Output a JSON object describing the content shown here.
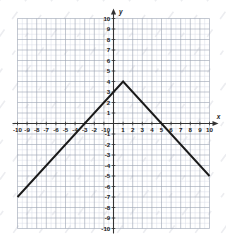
{
  "figure": {
    "kind": "coordinate-grid-plot",
    "background_color": "#ffffff",
    "grid": {
      "minor_color": "#d8dce6",
      "major_color": "#9aa3b2",
      "axis_color": "#333333",
      "minor_step": 0.5,
      "major_step": 1,
      "show_grid": true
    },
    "curve_color": "#1a1a1a",
    "watermark_color": "#e9eaee"
  },
  "axes": {
    "x_axis_label": "x",
    "y_axis_label": "y",
    "x_ticks": [
      "-10",
      "-9",
      "-8",
      "-7",
      "-6",
      "-5",
      "-4",
      "-3",
      "-2",
      "-1",
      "1",
      "2",
      "3",
      "4",
      "5",
      "6",
      "7",
      "8",
      "9",
      "10"
    ],
    "y_ticks": [
      "10",
      "9",
      "8",
      "7",
      "6",
      "5",
      "4",
      "3",
      "2",
      "1",
      "-1",
      "-2",
      "-3",
      "-4",
      "-5",
      "-6",
      "-7",
      "-8",
      "-9",
      "-10"
    ],
    "origin_label": "0"
  },
  "chart_data": {
    "type": "line",
    "title": "",
    "xlabel": "x",
    "ylabel": "y",
    "xlim": [
      -10,
      10
    ],
    "ylim": [
      -10,
      10
    ],
    "xticks": [
      -10,
      -9,
      -8,
      -7,
      -6,
      -5,
      -4,
      -3,
      -2,
      -1,
      0,
      1,
      2,
      3,
      4,
      5,
      6,
      7,
      8,
      9,
      10
    ],
    "yticks": [
      -10,
      -9,
      -8,
      -7,
      -6,
      -5,
      -4,
      -3,
      -2,
      -1,
      0,
      1,
      2,
      3,
      4,
      5,
      6,
      7,
      8,
      9,
      10
    ],
    "grid": true,
    "minor_grid_step": 0.5,
    "legend": null,
    "series": [
      {
        "name": "absolute value graph",
        "shape": "inverted-v",
        "vertex": [
          1,
          4
        ],
        "points": [
          [
            -10,
            -7
          ],
          [
            1,
            4
          ],
          [
            10,
            -5
          ]
        ],
        "x_intercepts": [
          -3,
          5
        ],
        "y_intercept": 3,
        "left_slope": 1,
        "right_slope": -1
      }
    ]
  }
}
